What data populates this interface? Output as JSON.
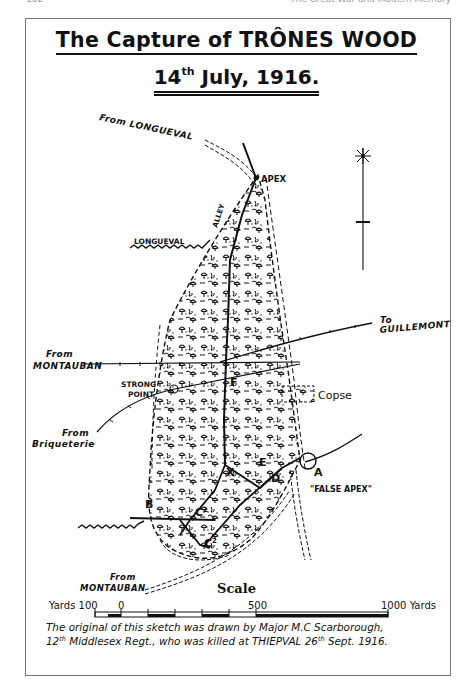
{
  "page": {
    "page_number": "162",
    "running_head": "The Great War and Modern Memory"
  },
  "map": {
    "title": "The Capture of TRÔNES WOOD",
    "date_day": "14",
    "date_suffix": "th",
    "date_rest": " July, 1916.",
    "labels": {
      "from_longueval": "From LONGUEVAL",
      "apex": "APEX",
      "alley": "ALLEY",
      "longueval_alley": "LONGUEVAL",
      "to": "To",
      "guillemont": "GUILLEMONT",
      "from_montauban_1": "From",
      "montauban_1": "MONTAUBAN",
      "strong_point_1": "STRONG",
      "strong_point_2": "POINT",
      "copse": "Copse",
      "from_briqueterie_1": "From",
      "briqueterie": "Briqueterie",
      "false_apex": "\"FALSE APEX\"",
      "from_montauban_2": "From",
      "montauban_2": "MONTAUBAN"
    },
    "point_letters": {
      "A": "A",
      "B": "B",
      "C1": "C",
      "C1_sup": "1",
      "C2": "C",
      "C2_sup": "2",
      "D": "D",
      "E": "E",
      "F": "F",
      "X": "X"
    },
    "north_symbol": "compass-star"
  },
  "scale": {
    "title": "Scale",
    "left_label": "Yards 100",
    "zero_label": "0",
    "mid_label": "500",
    "right_label": "1000 Yards"
  },
  "caption": {
    "line1": "The original of this sketch was drawn by Major M.C Scarborough,",
    "line2_a": "12",
    "line2_a_sup": "th",
    "line2_b": " Middlesex Regt., who was killed at THIEPVAL 26",
    "line2_b_sup": "th",
    "line2_c": " Sept. 1916."
  },
  "colors": {
    "ink": "#111111",
    "paper": "#ffffff",
    "frame": "#777777"
  }
}
